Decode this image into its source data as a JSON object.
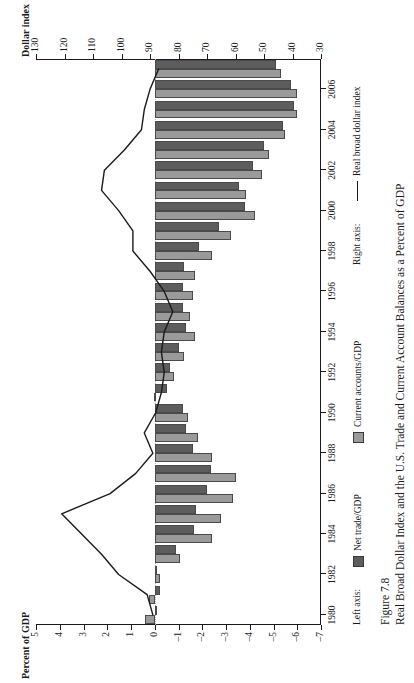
{
  "figure": {
    "number_label": "Figure 7.8",
    "caption": "Real Broad Dollar Index and the U.S. Trade and Current Account Balances as a Percent of GDP"
  },
  "axes": {
    "left_title": "Percent of GDP",
    "right_title": "Dollar index",
    "left_ticks": [
      "5",
      "4",
      "3",
      "2",
      "1",
      "0",
      "-1",
      "-2",
      "-3",
      "-4",
      "-5",
      "-6",
      "-7"
    ],
    "right_ticks": [
      "130",
      "120",
      "110",
      "100",
      "90",
      "80",
      "70",
      "60",
      "50",
      "40",
      "30"
    ],
    "year_ticks": [
      "1980",
      "1982",
      "1984",
      "1986",
      "1988",
      "1990",
      "1992",
      "1994",
      "1996",
      "1998",
      "2000",
      "2002",
      "2004",
      "2006"
    ]
  },
  "legend": {
    "left_axis_label": "Left axis:",
    "right_axis_label": "Right axis:",
    "net_trade_label": "Net trade/GDP",
    "current_account_label": "Current accounts/GDP",
    "dollar_index_label": "Real broad dollar index"
  },
  "colors": {
    "net_trade": "#5d5d5d",
    "current_account": "#9a9a9a",
    "dollar_line": "#1b1b1b",
    "axis": "#1b1b1b"
  },
  "chart_data": {
    "type": "bar",
    "title": "Real Broad Dollar Index and the U.S. Trade and Current Account Balances as a Percent of GDP",
    "xlabel": "",
    "ylabel": "Percent of GDP",
    "y2label": "Dollar index",
    "ylim": [
      -7,
      5
    ],
    "y2lim": [
      30,
      130
    ],
    "grid": false,
    "legend_position": "below",
    "categories": [
      1980,
      1981,
      1982,
      1983,
      1984,
      1985,
      1986,
      1987,
      1988,
      1989,
      1990,
      1991,
      1992,
      1993,
      1994,
      1995,
      1996,
      1997,
      1998,
      1999,
      2000,
      2001,
      2002,
      2003,
      2004,
      2005,
      2006,
      2007
    ],
    "series": [
      {
        "name": "Net trade/GDP",
        "axis": "left",
        "values": [
          -0.05,
          -0.2,
          -0.1,
          -0.9,
          -1.65,
          -1.75,
          -2.2,
          -2.35,
          -1.6,
          -1.3,
          -1.2,
          -0.5,
          -0.65,
          -1.0,
          -1.3,
          -1.2,
          -1.2,
          -1.25,
          -1.85,
          -2.7,
          -3.8,
          -3.55,
          -4.15,
          -4.6,
          -5.4,
          -5.85,
          -5.75,
          -5.1
        ]
      },
      {
        "name": "Current accounts/GDP",
        "axis": "left",
        "values": [
          0.4,
          0.25,
          -0.2,
          -1.05,
          -2.4,
          -2.8,
          -3.3,
          -3.4,
          -2.4,
          -1.8,
          -1.4,
          0.05,
          -0.8,
          -1.25,
          -1.7,
          -1.5,
          -1.6,
          -1.7,
          -2.4,
          -3.2,
          -4.2,
          -3.85,
          -4.5,
          -4.8,
          -5.5,
          -6.0,
          -6.0,
          -5.3
        ]
      },
      {
        "name": "Real broad dollar index",
        "axis": "right",
        "type": "line",
        "values": [
          89,
          91,
          101,
          107,
          114,
          121,
          104,
          95,
          89,
          92,
          88,
          86,
          85,
          86,
          85,
          82,
          85,
          90,
          96,
          96,
          101,
          107,
          106,
          99,
          93,
          92,
          90,
          87
        ]
      }
    ]
  }
}
